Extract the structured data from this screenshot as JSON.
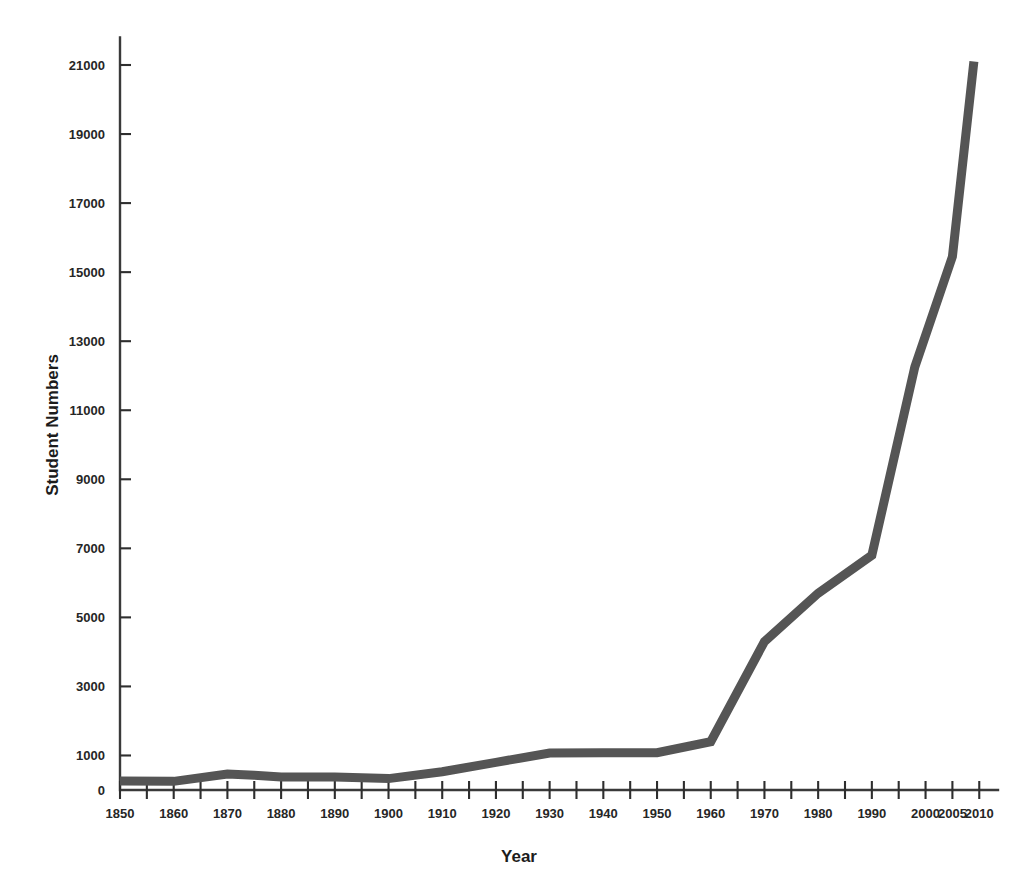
{
  "chart_data": {
    "type": "line",
    "title": "",
    "xlabel": "Year",
    "ylabel": "Student Numbers",
    "xlim": [
      1850,
      2012
    ],
    "ylim": [
      0,
      21500
    ],
    "grid": false,
    "legend": false,
    "line_color": "#555555",
    "axis_color": "#333333",
    "x_tick_values": [
      1850,
      1855,
      1860,
      1865,
      1870,
      1875,
      1880,
      1885,
      1890,
      1895,
      1900,
      1905,
      1910,
      1915,
      1920,
      1925,
      1930,
      1935,
      1940,
      1945,
      1950,
      1955,
      1960,
      1965,
      1970,
      1975,
      1980,
      1985,
      1990,
      1995,
      2000,
      2005,
      2010
    ],
    "x_tick_labels": [
      "1850",
      "",
      "1860",
      "",
      "1870",
      "",
      "1880",
      "",
      "1890",
      "",
      "1900",
      "",
      "1910",
      "",
      "1920",
      "",
      "1930",
      "",
      "1940",
      "",
      "1950",
      "",
      "1960",
      "",
      "1970",
      "",
      "1980",
      "",
      "1990",
      "",
      "2000",
      "2005",
      "2010"
    ],
    "y_tick_values": [
      0,
      1000,
      3000,
      5000,
      7000,
      9000,
      11000,
      13000,
      15000,
      17000,
      19000,
      21000
    ],
    "y_tick_labels": [
      "0",
      "1000",
      "3000",
      "5000",
      "7000",
      "9000",
      "11000",
      "13000",
      "15000",
      "17000",
      "19000",
      "21000"
    ],
    "series": [
      {
        "name": "Student Numbers",
        "x": [
          1850,
          1860,
          1870,
          1875,
          1880,
          1890,
          1900,
          1910,
          1920,
          1930,
          1940,
          1950,
          1960,
          1970,
          1980,
          1990,
          1998,
          2005,
          2009
        ],
        "values": [
          260,
          250,
          460,
          430,
          380,
          380,
          330,
          530,
          800,
          1070,
          1080,
          1080,
          1400,
          4300,
          5700,
          6800,
          12250,
          15450,
          21100
        ]
      }
    ]
  }
}
